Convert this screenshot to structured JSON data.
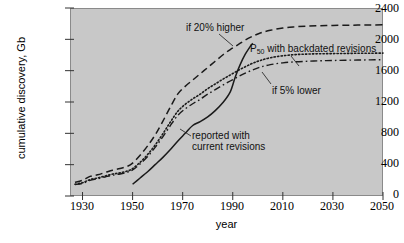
{
  "chart_data": {
    "type": "line",
    "title": "",
    "xlabel": "year",
    "ylabel": "cumulative discovery, Gb",
    "xlim": [
      1925,
      2050
    ],
    "ylim": [
      0,
      2400
    ],
    "grid": false,
    "legend_position": "inline-annotations",
    "xticks": [
      1930,
      1950,
      1970,
      1990,
      2010,
      2030,
      2050
    ],
    "yticks": [
      0,
      400,
      800,
      1200,
      1600,
      2000,
      2400
    ],
    "background_color": "#c8c8c8",
    "line_color": "#1a1a1a",
    "series": [
      {
        "name": "if 20% higher",
        "style": "dashed",
        "x": [
          1927,
          1930,
          1933,
          1936,
          1939,
          1942,
          1945,
          1948,
          1950,
          1953,
          1956,
          1959,
          1962,
          1965,
          1968,
          1971,
          1974,
          1977,
          1980,
          1983,
          1986,
          1989,
          1992,
          1995,
          1998,
          2001,
          2005,
          2010,
          2015,
          2020,
          2025,
          2030,
          2035,
          2040,
          2045,
          2050
        ],
        "values": [
          175,
          200,
          250,
          270,
          300,
          330,
          350,
          380,
          420,
          520,
          640,
          780,
          950,
          1130,
          1300,
          1400,
          1480,
          1560,
          1640,
          1720,
          1800,
          1870,
          1930,
          1990,
          2040,
          2080,
          2115,
          2145,
          2160,
          2170,
          2175,
          2178,
          2180,
          2182,
          2184,
          2185
        ]
      },
      {
        "name": "P50 with backdated revisions",
        "style": "dotted",
        "x": [
          1927,
          1930,
          1933,
          1936,
          1939,
          1942,
          1945,
          1948,
          1950,
          1953,
          1956,
          1959,
          1962,
          1965,
          1968,
          1971,
          1974,
          1977,
          1980,
          1983,
          1986,
          1989,
          1992,
          1995,
          1998,
          2001,
          2005,
          2010,
          2015,
          2020,
          2025,
          2030,
          2035,
          2040,
          2045,
          2050
        ],
        "values": [
          150,
          170,
          210,
          230,
          255,
          280,
          295,
          320,
          350,
          430,
          530,
          650,
          790,
          940,
          1080,
          1170,
          1240,
          1300,
          1370,
          1430,
          1490,
          1545,
          1600,
          1650,
          1695,
          1730,
          1765,
          1790,
          1805,
          1812,
          1816,
          1818,
          1820,
          1822,
          1823,
          1824
        ]
      },
      {
        "name": "if 5% lower",
        "style": "dash-dot",
        "x": [
          1927,
          1930,
          1933,
          1936,
          1939,
          1942,
          1945,
          1948,
          1950,
          1953,
          1956,
          1959,
          1962,
          1965,
          1968,
          1971,
          1974,
          1977,
          1980,
          1983,
          1986,
          1989,
          1992,
          1995,
          1998,
          2001,
          2005,
          2010,
          2015,
          2020,
          2025,
          2030,
          2035,
          2040,
          2045,
          2050
        ],
        "values": [
          145,
          162,
          200,
          220,
          243,
          266,
          281,
          305,
          333,
          410,
          505,
          620,
          752,
          895,
          1028,
          1112,
          1178,
          1235,
          1300,
          1358,
          1415,
          1468,
          1520,
          1568,
          1610,
          1645,
          1677,
          1700,
          1713,
          1720,
          1726,
          1730,
          1733,
          1736,
          1738,
          1740
        ]
      },
      {
        "name": "reported with current revisions",
        "style": "solid",
        "x": [
          1950,
          1953,
          1956,
          1959,
          1962,
          1965,
          1968,
          1971,
          1974,
          1977,
          1980,
          1983,
          1986,
          1989,
          1991,
          1993,
          1995,
          1997,
          1998
        ],
        "values": [
          150,
          230,
          310,
          400,
          490,
          590,
          700,
          800,
          900,
          950,
          1010,
          1090,
          1190,
          1330,
          1520,
          1680,
          1810,
          1910,
          1950
        ]
      }
    ],
    "annotations": [
      {
        "text": "if 20% higher",
        "target_series": "if 20% higher"
      },
      {
        "text": "P50 with backdated revisions",
        "text_prefix": "P",
        "text_sub": "50",
        "text_suffix": " with backdated revisions",
        "target_series": "P50 with backdated revisions"
      },
      {
        "text": "if 5% lower",
        "target_series": "if 5% lower"
      },
      {
        "text_line1": "reported with",
        "text_line2": "current revisions",
        "target_series": "reported with current revisions"
      }
    ]
  },
  "axes": {
    "ylabel": "cumulative discovery, Gb",
    "xlabel": "year",
    "yticks": [
      "0",
      "400",
      "800",
      "1200",
      "1600",
      "2000",
      "2400"
    ],
    "xticks": [
      "1930",
      "1950",
      "1970",
      "1990",
      "2010",
      "2030",
      "2050"
    ]
  },
  "annotations": {
    "higher": "if 20% higher",
    "p50_prefix": "P",
    "p50_sub": "50",
    "p50_suffix": " with backdated revisions",
    "lower": "if 5% lower",
    "reported_line1": "reported with",
    "reported_line2": "current revisions"
  }
}
